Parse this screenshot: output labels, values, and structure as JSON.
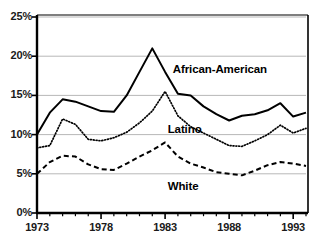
{
  "chart_data": {
    "type": "line",
    "title": "",
    "xlabel": "",
    "ylabel": "",
    "xlim": [
      1973,
      1994
    ],
    "ylim": [
      0,
      25
    ],
    "grid": true,
    "legend_position": "inline-annotations",
    "y_tick_labels": [
      "0%",
      "5%",
      "10%",
      "15%",
      "20%",
      "25%"
    ],
    "y_tick_values": [
      0,
      5,
      10,
      15,
      20,
      25
    ],
    "x_tick_labels": [
      "1973",
      "1978",
      "1983",
      "1988",
      "1993"
    ],
    "x_tick_values": [
      1973,
      1978,
      1983,
      1988,
      1993
    ],
    "x_minor_ticks": [
      1974,
      1975,
      1976,
      1977,
      1979,
      1980,
      1981,
      1982,
      1984,
      1985,
      1986,
      1987,
      1989,
      1990,
      1991,
      1992,
      1994
    ],
    "x": [
      1973,
      1974,
      1975,
      1976,
      1977,
      1978,
      1979,
      1980,
      1981,
      1982,
      1983,
      1984,
      1985,
      1986,
      1987,
      1988,
      1989,
      1990,
      1991,
      1992,
      1993,
      1994
    ],
    "series": [
      {
        "name": "African-American",
        "style": "solid",
        "color": "#000000",
        "label_x": 1983.6,
        "label_y": 18.2,
        "values": [
          10.0,
          12.8,
          14.5,
          14.2,
          13.6,
          13.0,
          12.9,
          15.0,
          18.0,
          21.0,
          18.0,
          15.2,
          15.0,
          13.6,
          12.6,
          11.8,
          12.4,
          12.6,
          13.1,
          14.0,
          12.3,
          12.8
        ]
      },
      {
        "name": "Latino",
        "style": "dotted",
        "color": "#000000",
        "label_x": 1983.2,
        "label_y": 10.6,
        "values": [
          8.3,
          8.6,
          12.0,
          11.3,
          9.4,
          9.2,
          9.6,
          10.3,
          11.5,
          13.0,
          15.5,
          12.4,
          11.0,
          10.2,
          9.4,
          8.6,
          8.5,
          9.2,
          10.0,
          11.2,
          10.2,
          10.8
        ]
      },
      {
        "name": "White",
        "style": "dashed",
        "color": "#000000",
        "label_x": 1983.2,
        "label_y": 3.3,
        "values": [
          5.0,
          6.5,
          7.3,
          7.2,
          6.2,
          5.6,
          5.5,
          6.3,
          7.2,
          8.0,
          9.0,
          7.2,
          6.3,
          5.8,
          5.2,
          5.0,
          4.8,
          5.4,
          6.1,
          6.5,
          6.3,
          6.0
        ]
      }
    ]
  },
  "axes": {
    "y_labels": [
      {
        "text": "25%",
        "value": 25
      },
      {
        "text": "20%",
        "value": 20
      },
      {
        "text": "15%",
        "value": 15
      },
      {
        "text": "10%",
        "value": 10
      },
      {
        "text": "5%",
        "value": 5
      },
      {
        "text": "0%",
        "value": 0
      }
    ],
    "x_labels": [
      {
        "text": "1973",
        "value": 1973
      },
      {
        "text": "1978",
        "value": 1978
      },
      {
        "text": "1983",
        "value": 1983
      },
      {
        "text": "1988",
        "value": 1988
      },
      {
        "text": "1993",
        "value": 1993
      }
    ]
  },
  "annotations": {
    "african_american": "African-American",
    "latino": "Latino",
    "white": "White"
  },
  "colors": {
    "line": "#000000",
    "grid": "#9a9a9a",
    "axis": "#000000",
    "background": "#ffffff"
  }
}
